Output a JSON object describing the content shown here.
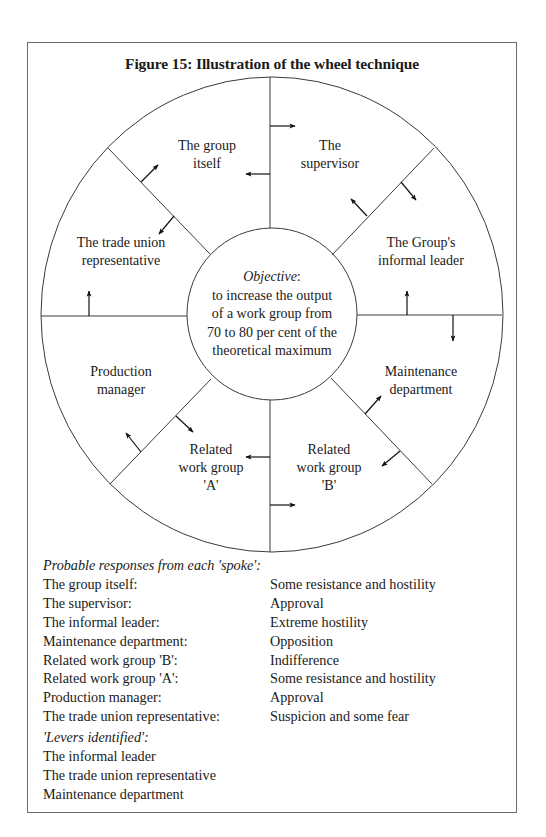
{
  "figure": {
    "title": "Figure 15: Illustration of the wheel technique"
  },
  "wheel": {
    "objective_label": "Objective",
    "objective_colon": ":",
    "objective_lines": [
      "to increase the output",
      "of a work group from",
      "70 to 80 per cent of the",
      "theoretical maximum"
    ],
    "segments": [
      {
        "lines": [
          "The group",
          "itself"
        ]
      },
      {
        "lines": [
          "The",
          "supervisor"
        ]
      },
      {
        "lines": [
          "The Group's",
          "informal leader"
        ]
      },
      {
        "lines": [
          "Maintenance",
          "department"
        ]
      },
      {
        "lines": [
          "Related",
          "work group",
          "'B'"
        ]
      },
      {
        "lines": [
          "Related",
          "work group",
          "'A'"
        ]
      },
      {
        "lines": [
          "Production",
          "manager"
        ]
      },
      {
        "lines": [
          "The trade union",
          "representative"
        ]
      }
    ]
  },
  "responses": {
    "header": "Probable responses from each 'spoke':",
    "rows": [
      {
        "who": "The group itself:",
        "response": "Some resistance and hostility"
      },
      {
        "who": "The supervisor:",
        "response": "Approval"
      },
      {
        "who": "The informal leader:",
        "response": "Extreme hostility"
      },
      {
        "who": "Maintenance department:",
        "response": "Opposition"
      },
      {
        "who": "Related work group 'B':",
        "response": "Indifference"
      },
      {
        "who": "Related work group 'A':",
        "response": "Some resistance and hostility"
      },
      {
        "who": "Production manager:",
        "response": "Approval"
      },
      {
        "who": "The trade union representative:",
        "response": "Suspicion and some fear"
      }
    ]
  },
  "levers": {
    "header": "'Levers identified':",
    "items": [
      "The informal leader",
      "The trade union representative",
      "Maintenance department"
    ]
  }
}
